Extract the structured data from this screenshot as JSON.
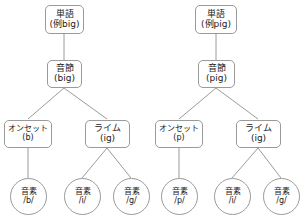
{
  "diagram": {
    "stroke_color": "#9a9a9a",
    "text_color": "#1a1a1a",
    "background_color": "#ffffff",
    "width": 303,
    "height": 221
  },
  "trees": [
    {
      "id": "tree-big",
      "word": {
        "line1": "単語",
        "line2": "(例big)"
      },
      "syllable": {
        "line1": "音節",
        "line2": "(big)"
      },
      "onset": {
        "line1": "オンセット",
        "line2": "(b)"
      },
      "rime": {
        "line1": "ライム",
        "line2": "(ig)"
      },
      "phonemes": [
        {
          "line1": "音素",
          "line2": "/b/"
        },
        {
          "line1": "音素",
          "line2": "/i/"
        },
        {
          "line1": "音素",
          "line2": "/g/"
        }
      ]
    },
    {
      "id": "tree-pig",
      "word": {
        "line1": "単語",
        "line2": "(例pig)"
      },
      "syllable": {
        "line1": "音節",
        "line2": "(pig)"
      },
      "onset": {
        "line1": "オンセット",
        "line2": "(p)"
      },
      "rime": {
        "line1": "ライム",
        "line2": "(ig)"
      },
      "phonemes": [
        {
          "line1": "音素",
          "line2": "/p/"
        },
        {
          "line1": "音素",
          "line2": "/i/"
        },
        {
          "line1": "音素",
          "line2": "/g/"
        }
      ]
    }
  ]
}
